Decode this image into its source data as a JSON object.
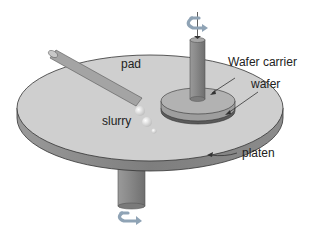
{
  "diagram": {
    "labels": {
      "pad": "pad",
      "wafer_carrier": "Wafer carrier",
      "wafer": "wafer",
      "slurry": "slurry",
      "platen": "platen"
    },
    "components": [
      {
        "id": "pad",
        "shape": "ellipse-top-surface"
      },
      {
        "id": "platen",
        "shape": "disk-side-band"
      },
      {
        "id": "platen-shaft",
        "shape": "vertical-cylinder"
      },
      {
        "id": "wafer-carrier",
        "shape": "small-disk"
      },
      {
        "id": "carrier-shaft",
        "shape": "vertical-cylinder"
      },
      {
        "id": "wafer",
        "shape": "thin-disk-under-carrier"
      },
      {
        "id": "slurry-nozzle",
        "shape": "angled-tube"
      },
      {
        "id": "slurry-droplets",
        "shape": "spheres"
      }
    ],
    "icons": [
      "rotation-arrow-icon (carrier shaft, top)",
      "rotation-arrow-icon (platen shaft, bottom)"
    ],
    "colors": {
      "pad_surface": "#cfcfcf",
      "platen_side": "#8a8a8a",
      "shaft": "#8c8c8c",
      "carrier": "#b0b0b0",
      "wafer": "#5a5a5a",
      "rotation_arrow": "#8fa3b5",
      "outline": "#333333",
      "background": "#ffffff"
    }
  }
}
